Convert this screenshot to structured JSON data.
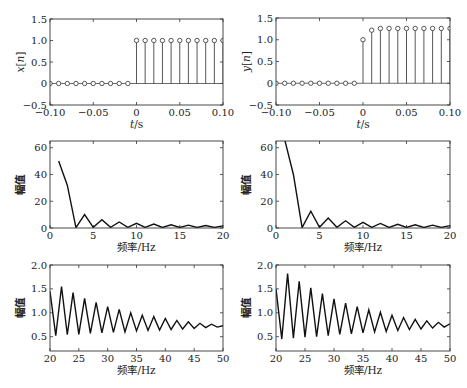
{
  "chart_data": [
    {
      "id": "x_n",
      "type": "stem",
      "title": "",
      "xlabel": "t/s",
      "ylabel": "x[n]",
      "xlim": [
        -0.1,
        0.1
      ],
      "ylim": [
        -0.5,
        1.5
      ],
      "xticks": [
        "-0.10",
        "-0.05",
        "0",
        "0.05",
        "0.10"
      ],
      "yticks": [
        "-0.5",
        "0",
        "0.5",
        "1.0",
        "1.5"
      ],
      "x": [
        -0.1,
        -0.09,
        -0.08,
        -0.07,
        -0.06,
        -0.05,
        -0.04,
        -0.03,
        -0.02,
        -0.01,
        0,
        0.01,
        0.02,
        0.03,
        0.04,
        0.05,
        0.06,
        0.07,
        0.08,
        0.09,
        0.1
      ],
      "values": [
        0,
        0,
        0,
        0,
        0,
        0,
        0,
        0,
        0,
        0,
        1,
        1,
        1,
        1,
        1,
        1,
        1,
        1,
        1,
        1,
        1
      ],
      "box": [
        50,
        19,
        223,
        105
      ]
    },
    {
      "id": "y_n",
      "type": "stem",
      "title": "",
      "xlabel": "t/s",
      "ylabel": "y[n]",
      "xlim": [
        -0.1,
        0.1
      ],
      "ylim": [
        -0.5,
        1.5
      ],
      "xticks": [
        "-0.10",
        "-0.05",
        "0",
        "0.05",
        "0.10"
      ],
      "yticks": [
        "-0.5",
        "0",
        "0.5",
        "1.0",
        "1.5"
      ],
      "x": [
        -0.1,
        -0.09,
        -0.08,
        -0.07,
        -0.06,
        -0.05,
        -0.04,
        -0.03,
        -0.02,
        -0.01,
        0,
        0.01,
        0.02,
        0.03,
        0.04,
        0.05,
        0.06,
        0.07,
        0.08,
        0.09,
        0.1
      ],
      "values": [
        0,
        0,
        0,
        0,
        0,
        0,
        0,
        0,
        0,
        0,
        1.0,
        1.22,
        1.26,
        1.26,
        1.26,
        1.26,
        1.26,
        1.26,
        1.26,
        1.26,
        1.26
      ],
      "box": [
        276,
        18,
        450,
        105
      ]
    },
    {
      "id": "X_spectrum_low",
      "type": "line",
      "title": "",
      "xlabel": "频率/Hz",
      "ylabel": "幅值",
      "xlim": [
        0,
        20
      ],
      "ylim": [
        0,
        65
      ],
      "xticks": [
        "0",
        "5",
        "10",
        "15",
        "20"
      ],
      "yticks": [
        "0",
        "20",
        "40",
        "60"
      ],
      "x": [
        1,
        2,
        3,
        4,
        5,
        6,
        7,
        8,
        9,
        10,
        11,
        12,
        13,
        14,
        15,
        16,
        17,
        18,
        19,
        20
      ],
      "values": [
        50,
        32,
        0.3,
        10,
        0.5,
        6.2,
        0.5,
        4.5,
        0.5,
        3.5,
        0.5,
        2.9,
        0.4,
        2.4,
        0.4,
        2.1,
        0.4,
        1.8,
        0.4,
        1.6
      ],
      "box": [
        50,
        141,
        223,
        228
      ]
    },
    {
      "id": "Y_spectrum_low",
      "type": "line",
      "title": "",
      "xlabel": "频率/Hz",
      "ylabel": "幅值",
      "xlim": [
        0,
        20
      ],
      "ylim": [
        0,
        65
      ],
      "xticks": [
        "0",
        "5",
        "10",
        "15",
        "20"
      ],
      "yticks": [
        "0",
        "20",
        "40",
        "60"
      ],
      "x": [
        1,
        2,
        3,
        4,
        5,
        6,
        7,
        8,
        9,
        10,
        11,
        12,
        13,
        14,
        15,
        16,
        17,
        18,
        19,
        20
      ],
      "values": [
        66,
        40,
        0.3,
        12.5,
        0.5,
        7.5,
        0.5,
        5.4,
        0.5,
        4.2,
        0.5,
        3.4,
        0.4,
        2.8,
        0.4,
        2.4,
        0.4,
        2.1,
        0.4,
        1.8
      ],
      "box": [
        276,
        141,
        450,
        228
      ]
    },
    {
      "id": "X_spectrum_high",
      "type": "line",
      "title": "",
      "xlabel": "频率/Hz",
      "ylabel": "幅值",
      "xlim": [
        20,
        50
      ],
      "ylim": [
        0.2,
        2.0
      ],
      "xticks": [
        "20",
        "25",
        "30",
        "35",
        "40",
        "45",
        "50"
      ],
      "yticks": [
        "0.5",
        "1.0",
        "1.5",
        "2.0"
      ],
      "x": [
        20,
        21,
        22,
        23,
        24,
        25,
        26,
        27,
        28,
        29,
        30,
        31,
        32,
        33,
        34,
        35,
        36,
        37,
        38,
        39,
        40,
        41,
        42,
        43,
        44,
        45,
        46,
        47,
        48,
        49,
        50
      ],
      "values": [
        1.45,
        0.52,
        1.55,
        0.54,
        1.42,
        0.55,
        1.3,
        0.57,
        1.22,
        0.58,
        1.13,
        0.59,
        1.07,
        0.6,
        1.0,
        0.62,
        0.95,
        0.63,
        0.92,
        0.64,
        0.88,
        0.65,
        0.84,
        0.66,
        0.81,
        0.67,
        0.78,
        0.69,
        0.76,
        0.7,
        0.73
      ],
      "box": [
        50,
        265,
        223,
        351
      ]
    },
    {
      "id": "Y_spectrum_high",
      "type": "line",
      "title": "",
      "xlabel": "频率/Hz",
      "ylabel": "幅值",
      "xlim": [
        20,
        50
      ],
      "ylim": [
        0.2,
        2.0
      ],
      "xticks": [
        "20",
        "25",
        "30",
        "35",
        "40",
        "45",
        "50"
      ],
      "yticks": [
        "0.5",
        "1.0",
        "1.5",
        "2.0"
      ],
      "x": [
        20,
        21,
        22,
        23,
        24,
        25,
        26,
        27,
        28,
        29,
        30,
        31,
        32,
        33,
        34,
        35,
        36,
        37,
        38,
        39,
        40,
        41,
        42,
        43,
        44,
        45,
        46,
        47,
        48,
        49,
        50
      ],
      "values": [
        1.5,
        0.45,
        1.82,
        0.47,
        1.66,
        0.49,
        1.52,
        0.5,
        1.4,
        0.52,
        1.29,
        0.55,
        1.2,
        0.56,
        1.13,
        0.58,
        1.06,
        0.6,
        1.01,
        0.61,
        0.95,
        0.63,
        0.9,
        0.65,
        0.86,
        0.66,
        0.83,
        0.68,
        0.8,
        0.7,
        0.77
      ],
      "box": [
        276,
        265,
        450,
        351
      ]
    }
  ]
}
